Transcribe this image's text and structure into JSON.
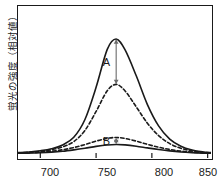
{
  "chart_data": {
    "type": "line",
    "title": "",
    "xlabel": "",
    "ylabel": "蛍光の強度（相対値）",
    "xlim": [
      680,
      853
    ],
    "ylim": [
      0,
      1.0
    ],
    "xticks": [
      700,
      750,
      800,
      850
    ],
    "xtick_labels": [
      "700",
      "750",
      "800",
      "850"
    ],
    "yticks": [],
    "grid": false,
    "legend": "none",
    "peak_x": 768,
    "series": [
      {
        "name": "upper-solid",
        "style": "solid",
        "peak_value": 1.0,
        "half_width": 26,
        "x": [
          680,
          690,
          700,
          710,
          720,
          730,
          740,
          750,
          760,
          768,
          776,
          786,
          796,
          806,
          816,
          826,
          836,
          846,
          853
        ],
        "y": [
          0.012,
          0.018,
          0.028,
          0.045,
          0.078,
          0.145,
          0.3,
          0.58,
          0.91,
          1.0,
          0.905,
          0.68,
          0.43,
          0.245,
          0.13,
          0.068,
          0.035,
          0.018,
          0.012
        ]
      },
      {
        "name": "upper-dashed",
        "style": "dashed",
        "peak_value": 0.605,
        "half_width": 28,
        "x": [
          680,
          690,
          700,
          710,
          720,
          730,
          740,
          750,
          760,
          768,
          776,
          786,
          796,
          806,
          816,
          826,
          836,
          846,
          853
        ],
        "y": [
          0.01,
          0.015,
          0.023,
          0.037,
          0.062,
          0.108,
          0.205,
          0.37,
          0.55,
          0.605,
          0.548,
          0.41,
          0.268,
          0.16,
          0.09,
          0.05,
          0.027,
          0.014,
          0.01
        ]
      },
      {
        "name": "lower-dashed",
        "style": "dashed",
        "peak_value": 0.143,
        "half_width": 34,
        "x": [
          680,
          690,
          700,
          710,
          720,
          730,
          740,
          750,
          760,
          768,
          776,
          786,
          796,
          806,
          816,
          826,
          836,
          846,
          853
        ],
        "y": [
          0.008,
          0.011,
          0.016,
          0.024,
          0.037,
          0.056,
          0.082,
          0.112,
          0.136,
          0.143,
          0.135,
          0.112,
          0.084,
          0.059,
          0.039,
          0.025,
          0.016,
          0.01,
          0.008
        ]
      },
      {
        "name": "lower-solid",
        "style": "solid",
        "peak_value": 0.082,
        "half_width": 38,
        "x": [
          680,
          690,
          700,
          710,
          720,
          730,
          740,
          750,
          760,
          768,
          776,
          786,
          796,
          806,
          816,
          826,
          836,
          846,
          853
        ],
        "y": [
          0.006,
          0.008,
          0.011,
          0.016,
          0.024,
          0.036,
          0.05,
          0.066,
          0.078,
          0.082,
          0.079,
          0.068,
          0.053,
          0.039,
          0.027,
          0.018,
          0.012,
          0.008,
          0.006
        ]
      }
    ],
    "annotations": [
      {
        "label": "A",
        "kind": "double-arrow",
        "x": 768,
        "y_top": 1.0,
        "y_bottom": 0.605,
        "label_side": "left"
      },
      {
        "label": "B",
        "kind": "double-arrow",
        "x": 768,
        "y_top": 0.143,
        "y_bottom": 0.082,
        "label_side": "left"
      }
    ]
  },
  "colors": {
    "axis": "#1a1a1a",
    "curve": "#1a1a1a",
    "arrow": "#6b6b6b",
    "background": "#ffffff"
  }
}
